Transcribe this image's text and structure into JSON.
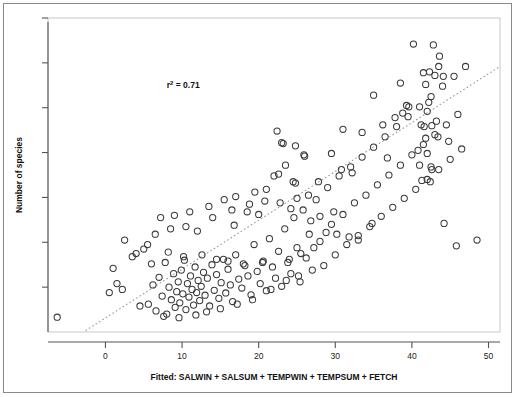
{
  "chart_data": {
    "type": "scatter",
    "title": "",
    "subtitle": "",
    "xlabel": "Fitted: SALWIN + SALSUM + TEMPWIN + TEMPSUM + FETCH",
    "ylabel": "Number of species",
    "xlim": [
      -7.5,
      51.5
    ],
    "ylim": [
      0,
      7
    ],
    "grid": false,
    "legend": null,
    "x_ticks": [
      0,
      10,
      20,
      30,
      40,
      50
    ],
    "x_tick_labels": [
      "0",
      "10",
      "20",
      "30",
      "40",
      "50"
    ],
    "y_ticks": [
      1,
      2,
      3,
      4,
      5,
      6,
      7
    ],
    "y_tick_labels": [
      "",
      "",
      "",
      "",
      "",
      "",
      ""
    ],
    "marker": "open-circle",
    "marker_color": "#3b3b3b",
    "annotations": [
      {
        "text": "r² = 0.71",
        "base": "r",
        "superscript": "2",
        "rest": " = 0.71",
        "x": 8.0,
        "y": 5.45
      }
    ],
    "fit_line": {
      "style": "dotted",
      "color": "#999999",
      "x_start": -2.6,
      "y_start": 0.03,
      "x_end": 51.5,
      "y_end": 5.92
    },
    "points": [
      [
        -6.3,
        0.33
      ],
      [
        1.0,
        1.42
      ],
      [
        2.2,
        0.95
      ],
      [
        4.0,
        1.75
      ],
      [
        5.6,
        0.62
      ],
      [
        6.2,
        1.05
      ],
      [
        6.6,
        0.47
      ],
      [
        7.0,
        1.22
      ],
      [
        7.4,
        0.8
      ],
      [
        7.8,
        1.55
      ],
      [
        8.0,
        0.4
      ],
      [
        8.3,
        1.0
      ],
      [
        8.6,
        0.72
      ],
      [
        8.9,
        1.3
      ],
      [
        9.1,
        0.55
      ],
      [
        9.3,
        0.9
      ],
      [
        9.5,
        1.12
      ],
      [
        9.7,
        0.65
      ],
      [
        9.9,
        1.38
      ],
      [
        10.1,
        0.85
      ],
      [
        10.3,
        1.6
      ],
      [
        10.5,
        0.5
      ],
      [
        10.7,
        1.08
      ],
      [
        10.9,
        0.78
      ],
      [
        11.1,
        1.25
      ],
      [
        11.3,
        0.95
      ],
      [
        11.5,
        0.6
      ],
      [
        11.7,
        1.45
      ],
      [
        11.9,
        0.88
      ],
      [
        12.1,
        1.15
      ],
      [
        12.3,
        0.7
      ],
      [
        12.5,
        1.02
      ],
      [
        12.8,
        1.33
      ],
      [
        13.0,
        0.82
      ],
      [
        13.3,
        1.2
      ],
      [
        13.6,
        0.58
      ],
      [
        13.9,
        1.5
      ],
      [
        14.2,
        0.93
      ],
      [
        14.5,
        1.28
      ],
      [
        14.8,
        0.75
      ],
      [
        15.1,
        1.1
      ],
      [
        15.4,
        1.62
      ],
      [
        15.7,
        0.87
      ],
      [
        16.0,
        1.4
      ],
      [
        16.3,
        1.05
      ],
      [
        16.6,
        0.68
      ],
      [
        17.0,
        1.72
      ],
      [
        17.4,
        1.18
      ],
      [
        17.8,
        0.98
      ],
      [
        18.2,
        1.48
      ],
      [
        18.6,
        1.25
      ],
      [
        19.0,
        0.83
      ],
      [
        19.4,
        1.95
      ],
      [
        19.8,
        1.35
      ],
      [
        20.2,
        1.08
      ],
      [
        20.6,
        1.58
      ],
      [
        21.0,
        0.92
      ],
      [
        21.4,
        2.08
      ],
      [
        21.8,
        1.45
      ],
      [
        22.2,
        1.2
      ],
      [
        22.6,
        1.8
      ],
      [
        23.0,
        1.02
      ],
      [
        23.4,
        2.3
      ],
      [
        23.8,
        1.55
      ],
      [
        24.2,
        1.3
      ],
      [
        24.6,
        2.55
      ],
      [
        25.0,
        1.88
      ],
      [
        25.4,
        1.12
      ],
      [
        25.8,
        2.72
      ],
      [
        26.2,
        1.65
      ],
      [
        26.6,
        2.18
      ],
      [
        27.0,
        1.38
      ],
      [
        27.5,
        2.95
      ],
      [
        28.0,
        2.02
      ],
      [
        28.5,
        1.48
      ],
      [
        29.0,
        3.22
      ],
      [
        29.5,
        2.4
      ],
      [
        30.0,
        1.72
      ],
      [
        30.5,
        3.48
      ],
      [
        31.0,
        2.62
      ],
      [
        31.5,
        1.95
      ],
      [
        32.0,
        3.68
      ],
      [
        32.5,
        2.88
      ],
      [
        33.0,
        2.15
      ],
      [
        33.5,
        3.9
      ],
      [
        34.0,
        3.05
      ],
      [
        34.5,
        2.35
      ],
      [
        35.0,
        4.12
      ],
      [
        35.5,
        3.28
      ],
      [
        36.0,
        2.58
      ],
      [
        36.5,
        4.35
      ],
      [
        37.0,
        3.5
      ],
      [
        37.5,
        2.78
      ],
      [
        38.0,
        4.58
      ],
      [
        38.5,
        3.72
      ],
      [
        39.0,
        2.98
      ],
      [
        39.5,
        4.8
      ],
      [
        40.0,
        3.95
      ],
      [
        40.5,
        3.18
      ],
      [
        41.0,
        5.02
      ],
      [
        41.5,
        4.18
      ],
      [
        42.0,
        3.4
      ],
      [
        42.5,
        5.25
      ],
      [
        43.0,
        4.4
      ],
      [
        43.5,
        3.62
      ],
      [
        44.0,
        5.48
      ],
      [
        44.5,
        4.62
      ],
      [
        45.0,
        3.85
      ],
      [
        45.5,
        5.7
      ],
      [
        46.0,
        4.85
      ],
      [
        46.5,
        4.08
      ],
      [
        47.0,
        5.92
      ],
      [
        48.5,
        2.05
      ],
      [
        40.2,
        6.42
      ],
      [
        42.8,
        6.4
      ],
      [
        43.6,
        6.15
      ],
      [
        43.5,
        5.92
      ],
      [
        41.5,
        5.78
      ],
      [
        42.3,
        5.8
      ],
      [
        43.0,
        5.72
      ],
      [
        44.1,
        5.7
      ],
      [
        41.8,
        5.52
      ],
      [
        38.5,
        5.55
      ],
      [
        39.3,
        5.05
      ],
      [
        39.6,
        5.02
      ],
      [
        42.2,
        5.12
      ],
      [
        42.0,
        4.92
      ],
      [
        41.2,
        4.62
      ],
      [
        41.6,
        4.58
      ],
      [
        42.6,
        4.6
      ],
      [
        43.2,
        4.7
      ],
      [
        41.8,
        4.32
      ],
      [
        43.4,
        4.35
      ],
      [
        40.8,
        4.05
      ],
      [
        42.0,
        3.98
      ],
      [
        44.8,
        4.25
      ],
      [
        36.8,
        3.88
      ],
      [
        41.0,
        3.72
      ],
      [
        42.5,
        3.68
      ],
      [
        42.6,
        3.62
      ],
      [
        41.3,
        3.38
      ],
      [
        42.4,
        3.35
      ],
      [
        35.0,
        5.28
      ],
      [
        34.8,
        2.42
      ],
      [
        44.2,
        2.42
      ],
      [
        45.8,
        1.92
      ],
      [
        22.4,
        4.48
      ],
      [
        23.0,
        4.22
      ],
      [
        23.2,
        4.2
      ],
      [
        24.8,
        4.15
      ],
      [
        25.9,
        3.95
      ],
      [
        26.0,
        3.92
      ],
      [
        23.5,
        3.72
      ],
      [
        22.6,
        3.52
      ],
      [
        22.0,
        3.48
      ],
      [
        24.5,
        3.35
      ],
      [
        24.8,
        3.32
      ],
      [
        21.0,
        3.18
      ],
      [
        25.0,
        2.98
      ],
      [
        26.5,
        3.05
      ],
      [
        27.8,
        3.35
      ],
      [
        29.5,
        3.98
      ],
      [
        31.0,
        4.52
      ],
      [
        33.5,
        4.45
      ],
      [
        20.0,
        2.62
      ],
      [
        18.5,
        2.68
      ],
      [
        16.5,
        2.72
      ],
      [
        14.0,
        2.55
      ],
      [
        12.0,
        2.25
      ],
      [
        10.5,
        2.35
      ],
      [
        8.5,
        2.3
      ],
      [
        6.5,
        2.18
      ],
      [
        5.0,
        1.85
      ],
      [
        3.5,
        1.68
      ],
      [
        2.5,
        2.05
      ],
      [
        1.5,
        1.08
      ],
      [
        0.5,
        0.88
      ],
      [
        4.5,
        0.58
      ],
      [
        5.5,
        1.95
      ],
      [
        7.2,
        2.55
      ],
      [
        9.0,
        2.6
      ],
      [
        11.0,
        2.68
      ],
      [
        13.5,
        2.8
      ],
      [
        15.5,
        2.95
      ],
      [
        17.0,
        3.02
      ],
      [
        19.5,
        3.12
      ],
      [
        28.8,
        2.22
      ],
      [
        30.2,
        2.18
      ],
      [
        31.8,
        2.12
      ],
      [
        33.0,
        2.05
      ],
      [
        26.8,
        2.48
      ],
      [
        28.0,
        2.58
      ],
      [
        29.8,
        2.68
      ],
      [
        27.2,
        1.88
      ],
      [
        25.5,
        1.75
      ],
      [
        24.0,
        1.62
      ],
      [
        20.5,
        1.55
      ],
      [
        18.0,
        1.52
      ],
      [
        16.0,
        1.58
      ],
      [
        14.5,
        1.62
      ],
      [
        12.6,
        1.72
      ],
      [
        10.2,
        1.68
      ],
      [
        8.2,
        1.78
      ],
      [
        6.0,
        1.52
      ],
      [
        19.2,
        0.72
      ],
      [
        21.6,
        0.95
      ],
      [
        23.6,
        1.15
      ],
      [
        25.2,
        1.25
      ],
      [
        13.2,
        0.45
      ],
      [
        15.0,
        0.52
      ],
      [
        17.2,
        0.62
      ],
      [
        11.8,
        0.38
      ],
      [
        9.6,
        0.32
      ],
      [
        7.6,
        0.35
      ],
      [
        20.8,
        2.92
      ],
      [
        22.8,
        2.88
      ],
      [
        24.2,
        2.75
      ],
      [
        18.8,
        2.85
      ],
      [
        16.8,
        2.38
      ],
      [
        30.8,
        3.62
      ],
      [
        32.2,
        3.55
      ],
      [
        36.2,
        4.62
      ],
      [
        37.8,
        4.78
      ],
      [
        38.8,
        4.88
      ]
    ]
  },
  "figure": {
    "background_color": "#ffffff",
    "frame_color": "#8a8a8a",
    "panel_border_color": "#c8c8c8",
    "axis_color": "#555555"
  }
}
